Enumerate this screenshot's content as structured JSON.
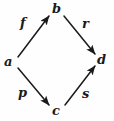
{
  "diagram": {
    "type": "commutative-square",
    "background_color": "#fefefe",
    "stroke_color": "#1a1a1a",
    "text_color": "#1a1a1a",
    "nodes": [
      {
        "id": "a",
        "label": "a",
        "position": "left",
        "x": 9,
        "y": 62
      },
      {
        "id": "b",
        "label": "b",
        "position": "top",
        "x": 56,
        "y": 9
      },
      {
        "id": "c",
        "label": "c",
        "position": "bottom",
        "x": 56,
        "y": 111
      },
      {
        "id": "d",
        "label": "d",
        "position": "right",
        "x": 101,
        "y": 60
      }
    ],
    "edges": [
      {
        "id": "f",
        "label": "f",
        "from": "a",
        "to": "b",
        "direction": "up-right",
        "arrowhead": "to",
        "x1": 18,
        "y1": 57,
        "x2": 49,
        "y2": 16,
        "label_x": 25,
        "label_y": 24
      },
      {
        "id": "r",
        "label": "r",
        "from": "b",
        "to": "d",
        "direction": "down-right",
        "arrowhead": "to",
        "x1": 64,
        "y1": 16,
        "x2": 95,
        "y2": 54,
        "label_x": 86,
        "label_y": 25
      },
      {
        "id": "p",
        "label": "p",
        "from": "a",
        "to": "c",
        "direction": "down-right",
        "arrowhead": "to",
        "x1": 18,
        "y1": 68,
        "x2": 49,
        "y2": 105,
        "label_x": 23,
        "label_y": 95
      },
      {
        "id": "s",
        "label": "s",
        "from": "c",
        "to": "d",
        "direction": "up-right",
        "arrowhead": "to",
        "x1": 65,
        "y1": 105,
        "x2": 95,
        "y2": 66,
        "label_x": 86,
        "label_y": 95
      }
    ]
  }
}
